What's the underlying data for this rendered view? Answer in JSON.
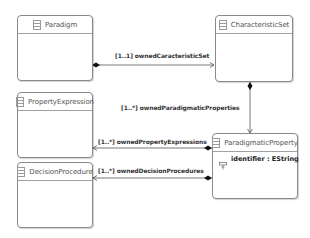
{
  "diagram": {
    "type": "uml-class-diagram",
    "classes": [
      {
        "id": "paradigm",
        "name": "Paradigm",
        "attributes": []
      },
      {
        "id": "characteristic_set",
        "name": "CharacteristicSet",
        "attributes": []
      },
      {
        "id": "property_expression",
        "name": "PropertyExpression",
        "attributes": []
      },
      {
        "id": "decision_procedure",
        "name": "DecisionProcedure",
        "attributes": []
      },
      {
        "id": "paradigmatic_property",
        "name": "ParadigmaticProperty",
        "attributes": [
          {
            "name": "identifier : EString",
            "icon": "attribute-icon"
          }
        ]
      }
    ],
    "references": [
      {
        "from": "Paradigm",
        "to": "CharacteristicSet",
        "kind": "containment",
        "label": "[1..1] ownedCaracteristicSet"
      },
      {
        "from": "CharacteristicSet",
        "to": "ParadigmaticProperty",
        "kind": "containment",
        "label": "[1..*] ownedParadigmaticProperties"
      },
      {
        "from": "ParadigmaticProperty",
        "to": "PropertyExpression",
        "kind": "containment",
        "label": "[1..*] ownedPropertyExpressions"
      },
      {
        "from": "ParadigmaticProperty",
        "to": "DecisionProcedure",
        "kind": "containment",
        "label": "[1..*] ownedDecisionProcedures"
      }
    ]
  },
  "colors": {
    "box_border": "#8a8a8a",
    "line": "#555555",
    "text": "#333333",
    "class_name": "#555555"
  }
}
